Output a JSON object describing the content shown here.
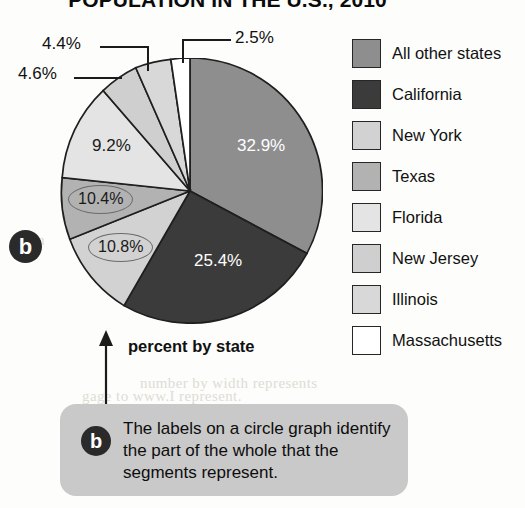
{
  "chart_data": {
    "type": "pie",
    "title": "POPULATION IN THE U.S., 2010",
    "xlabel": "",
    "ylabel": "",
    "axis_caption": "percent by state",
    "legend_position": "right",
    "grid": false,
    "unit": "percent",
    "categories": [
      "All other states",
      "California",
      "New York",
      "Texas",
      "Florida",
      "New Jersey",
      "Illinois",
      "Massachusetts"
    ],
    "values": [
      32.9,
      25.4,
      10.8,
      10.4,
      9.2,
      4.6,
      4.4,
      2.5
    ],
    "value_labels": [
      "32.9%",
      "25.4%",
      "10.8%",
      "10.4%",
      "9.2%",
      "4.6%",
      "4.4%",
      "2.5%"
    ],
    "colors": [
      "#8e8e8e",
      "#3b3b3b",
      "#d2d2d2",
      "#b2b2b2",
      "#e4e4e4",
      "#cfcfcf",
      "#d8d8d8",
      "#ffffff"
    ]
  },
  "title": "POPULATION IN THE U.S., 2010",
  "pie": {
    "inside_labels": [
      {
        "text": "32.9%",
        "tone": "on-dark"
      },
      {
        "text": "25.4%",
        "tone": "on-dark"
      },
      {
        "text": "9.2%",
        "tone": "on-light"
      }
    ],
    "circled_labels": [
      {
        "text": "10.4%"
      },
      {
        "text": "10.8%"
      }
    ],
    "leader_labels": [
      {
        "text": "2.5%"
      },
      {
        "text": "4.4%"
      },
      {
        "text": "4.6%"
      }
    ],
    "badge": "b"
  },
  "legend": {
    "items": [
      {
        "label": "All other states",
        "color": "#8e8e8e"
      },
      {
        "label": "California",
        "color": "#3b3b3b"
      },
      {
        "label": "New York",
        "color": "#d2d2d2"
      },
      {
        "label": "Texas",
        "color": "#b2b2b2"
      },
      {
        "label": "Florida",
        "color": "#e4e4e4"
      },
      {
        "label": "New Jersey",
        "color": "#cfcfcf"
      },
      {
        "label": "Illinois",
        "color": "#d8d8d8"
      },
      {
        "label": "Massachusetts",
        "color": "#ffffff"
      }
    ]
  },
  "axis_caption": "percent by state",
  "callout": {
    "badge": "b",
    "text": "The labels on a circle graph identify the part of the whole that the segments represent.",
    "background": "#c9c9c9"
  },
  "bleed_through": [
    {
      "text": "from",
      "x": 196,
      "y": 96
    },
    {
      "text": "over",
      "x": 206,
      "y": 126
    },
    {
      "text": "com",
      "x": 18,
      "y": 232
    },
    {
      "text": "number by width represents",
      "x": 140,
      "y": 375
    },
    {
      "text": "gage to www.I represent.",
      "x": 82,
      "y": 388
    }
  ]
}
